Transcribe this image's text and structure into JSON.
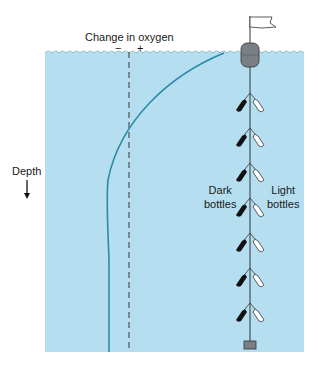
{
  "diagram": {
    "x_axis_title": "Change in oxygen",
    "x_axis_minus": "−",
    "x_axis_plus": "+",
    "y_axis_label": "Depth",
    "dark_bottles_label_line1": "Dark",
    "dark_bottles_label_line2": "bottles",
    "light_bottles_label_line1": "Light",
    "light_bottles_label_line2": "bottles",
    "bottle_pair_count": 7,
    "colors": {
      "water": "#b5dff0",
      "curve": "#2a8aa6",
      "buoy": "#7a7f86",
      "dark_bottle": "#111111",
      "light_bottle": "#ffffff",
      "line": "#333333"
    }
  }
}
